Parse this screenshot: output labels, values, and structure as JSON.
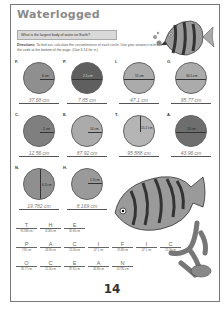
{
  "title": "Waterlogged",
  "question": "What is the largest body of water on Earth?",
  "directions_label": "Directions:",
  "directions_text": "To find out, calculate the circumference of each circle. Use your answers to break the code at the bottom of the page. (Use 3.14 for π.)",
  "colors": {
    "light_circle": "#ababab",
    "dark_circle": "#6e6e6e",
    "mid_circle": "#8f8f8f"
  },
  "circles": [
    {
      "letter": "F.",
      "measure": "6 cm",
      "type": "radius",
      "answer": "37.68 cm",
      "shade": "mid"
    },
    {
      "letter": "P.",
      "measure": "2.5 cm",
      "type": "diameter",
      "answer": "7.85 cm",
      "shade": "dark"
    },
    {
      "letter": "I.",
      "measure": "15 cm",
      "type": "diameter",
      "answer": "47.1 cm",
      "shade": "light"
    },
    {
      "letter": "O.",
      "measure": "30.5 cm",
      "type": "diameter",
      "answer": "95.77 cm",
      "shade": "light"
    },
    {
      "letter": "C.",
      "measure": "2 cm",
      "type": "radius",
      "answer": "12.56 cm",
      "shade": "mid"
    },
    {
      "letter": "E.",
      "measure": "14 cm",
      "type": "radius",
      "answer": "87.92 cm",
      "shade": "light"
    },
    {
      "letter": "T.",
      "measure": "15.2 cm",
      "type": "radius",
      "answer": "95.588 cm",
      "shade": "light"
    },
    {
      "letter": "A.",
      "measure": "14 cm",
      "type": "diameter",
      "answer": "43.96 cm",
      "shade": "dark"
    },
    {
      "letter": "N.",
      "measure": "6.3 cm",
      "type": "diameter",
      "answer": "19.782 cm",
      "shade": "mid"
    },
    {
      "letter": "H.",
      "measure": "1.3 cm",
      "type": "radius",
      "answer": "8.169 cm",
      "shade": "mid"
    }
  ],
  "code": [
    [
      {
        "letter": "T",
        "value": "95.588 cm"
      },
      {
        "letter": "H",
        "value": "8.169 cm"
      },
      {
        "letter": "E",
        "value": "92.96 cm"
      }
    ],
    [
      {
        "letter": "P",
        "value": "7.85 cm"
      },
      {
        "letter": "A",
        "value": "43.96 cm"
      },
      {
        "letter": "C",
        "value": "12.56 cm"
      },
      {
        "letter": "I",
        "value": "47.1 cm"
      },
      {
        "letter": "F",
        "value": "37.68 cm"
      },
      {
        "letter": "I",
        "value": "47.1 cm"
      },
      {
        "letter": "C",
        "value": "12.56 cm"
      }
    ],
    [
      {
        "letter": "O",
        "value": "95.77 cm"
      },
      {
        "letter": "C",
        "value": "12.56 cm"
      },
      {
        "letter": "E",
        "value": "87.92 cm"
      },
      {
        "letter": "A",
        "value": "43.96 cm"
      },
      {
        "letter": "N",
        "value": "19.782 cm"
      }
    ]
  ],
  "page_number": "14"
}
